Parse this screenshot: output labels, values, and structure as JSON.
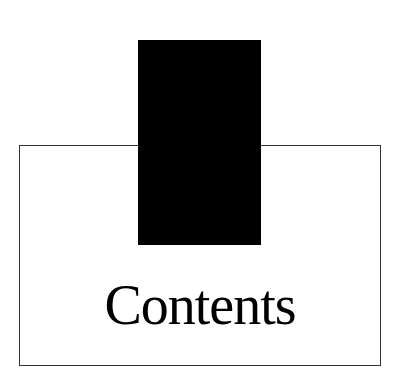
{
  "page": {
    "heading": "Contents",
    "colors": {
      "background": "#ffffff",
      "frame_border": "#333333",
      "block": "#000000",
      "text": "#000000"
    }
  }
}
